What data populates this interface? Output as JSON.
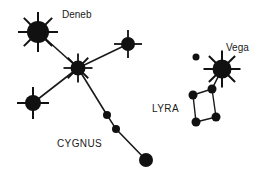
{
  "canvas": {
    "width": 269,
    "height": 179,
    "background": "#ffffff",
    "ink": "#111111",
    "text_color": "#1a1a1a"
  },
  "labels": {
    "deneb": {
      "text": "Deneb",
      "x": 62,
      "y": 18,
      "size": 10
    },
    "cygnus": {
      "text": "CYGNUS",
      "x": 57,
      "y": 147,
      "size": 10
    },
    "lyra": {
      "text": "LYRA",
      "x": 152,
      "y": 112,
      "size": 10
    },
    "vega": {
      "text": "Vega",
      "x": 226,
      "y": 51,
      "size": 10
    }
  },
  "chart_data": {
    "type": "scatter",
    "xlabel": "",
    "ylabel": "",
    "xlim": [
      0,
      269
    ],
    "ylim": [
      0,
      179
    ],
    "grid": false,
    "legend": false,
    "constellations": [
      {
        "name": "CYGNUS",
        "label_x": 57,
        "label_y": 147,
        "stars": [
          {
            "id": "deneb",
            "name": "Deneb",
            "x": 38,
            "y": 32,
            "r": 11,
            "rays": 8,
            "ray_len": 9,
            "ray_width": 2.0,
            "magnitude_class": "bright"
          },
          {
            "id": "sadr",
            "name": "",
            "x": 78,
            "y": 68,
            "r": 7.5,
            "rays": 8,
            "ray_len": 7,
            "ray_width": 1.8,
            "magnitude_class": "bright"
          },
          {
            "id": "gienah",
            "name": "",
            "x": 33,
            "y": 103,
            "r": 8,
            "rays": 4,
            "ray_len": 8,
            "ray_width": 2.0,
            "magnitude_class": "bright"
          },
          {
            "id": "delta",
            "name": "",
            "x": 128,
            "y": 44,
            "r": 7,
            "rays": 4,
            "ray_len": 7,
            "ray_width": 1.8,
            "magnitude_class": "bright"
          },
          {
            "id": "eta",
            "name": "",
            "x": 107,
            "y": 115,
            "r": 4,
            "rays": 0,
            "ray_len": 0,
            "ray_width": 0,
            "magnitude_class": "faint"
          },
          {
            "id": "chi",
            "name": "",
            "x": 116,
            "y": 129,
            "r": 4,
            "rays": 0,
            "ray_len": 0,
            "ray_width": 0,
            "magnitude_class": "faint"
          },
          {
            "id": "albireo",
            "name": "",
            "x": 146,
            "y": 160,
            "r": 7,
            "rays": 0,
            "ray_len": 0,
            "ray_width": 0,
            "magnitude_class": "medium"
          }
        ],
        "links": [
          [
            "deneb",
            "sadr"
          ],
          [
            "sadr",
            "gienah"
          ],
          [
            "sadr",
            "delta"
          ],
          [
            "sadr",
            "eta"
          ],
          [
            "eta",
            "chi"
          ],
          [
            "chi",
            "albireo"
          ]
        ]
      },
      {
        "name": "LYRA",
        "label_x": 152,
        "label_y": 112,
        "stars": [
          {
            "id": "vega",
            "name": "Vega",
            "x": 222,
            "y": 69,
            "r": 9.5,
            "rays": 8,
            "ray_len": 9,
            "ray_width": 2.0,
            "magnitude_class": "bright"
          },
          {
            "id": "epsilon",
            "name": "",
            "x": 196,
            "y": 57,
            "r": 3.5,
            "rays": 0,
            "ray_len": 0,
            "ray_width": 0,
            "magnitude_class": "faint"
          },
          {
            "id": "zeta",
            "name": "",
            "x": 212,
            "y": 89,
            "r": 4.5,
            "rays": 0,
            "ray_len": 0,
            "ray_width": 0,
            "magnitude_class": "faint"
          },
          {
            "id": "delta2",
            "name": "",
            "x": 193,
            "y": 95,
            "r": 4.5,
            "rays": 0,
            "ray_len": 0,
            "ray_width": 0,
            "magnitude_class": "faint"
          },
          {
            "id": "gamma",
            "name": "",
            "x": 216,
            "y": 117,
            "r": 4.5,
            "rays": 0,
            "ray_len": 0,
            "ray_width": 0,
            "magnitude_class": "faint"
          },
          {
            "id": "beta",
            "name": "",
            "x": 196,
            "y": 122,
            "r": 4.5,
            "rays": 0,
            "ray_len": 0,
            "ray_width": 0,
            "magnitude_class": "faint"
          }
        ],
        "links": [
          [
            "vega",
            "zeta"
          ],
          [
            "zeta",
            "delta2"
          ],
          [
            "delta2",
            "beta"
          ],
          [
            "beta",
            "gamma"
          ],
          [
            "gamma",
            "zeta"
          ]
        ]
      }
    ]
  }
}
